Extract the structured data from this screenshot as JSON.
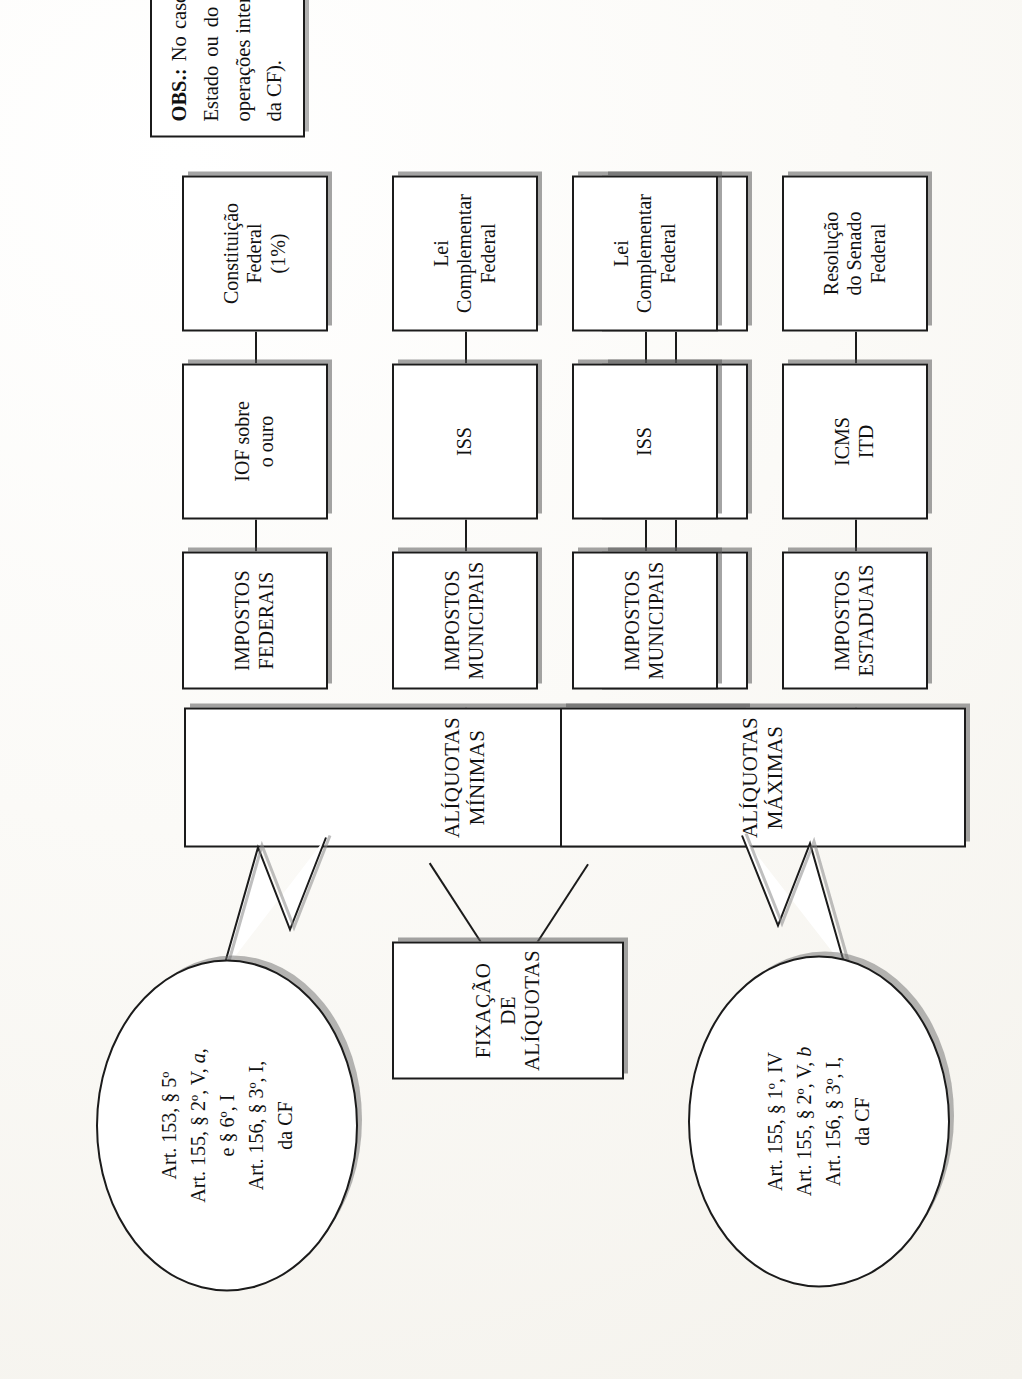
{
  "diagram": {
    "root": {
      "label": "FIXAÇÃO DE\nALÍQUOTAS"
    },
    "branches": [
      {
        "id": "minimas",
        "label": "ALÍQUOTAS\nMÍNIMAS",
        "callout": {
          "lines": [
            "Art. 153, § 5º",
            "Art. 155, § 2º, V, a,",
            "e § 6º, I",
            "Art. 156, § 3º, I,",
            "da CF"
          ]
        },
        "rows": [
          {
            "scope": "IMPOSTOS\nFEDERAIS",
            "tax": "IOF sobre\no ouro",
            "source": "Constituição\nFederal\n(1%)"
          },
          {
            "scope": "IMPOSTOS\nMUNICIPAIS",
            "tax": "ISS",
            "source": "Lei\nComplementar\nFederal"
          },
          {
            "scope": "IMPOSTOS\nESTADUAIS",
            "tax": "ICMS\nIPVA",
            "source": "Resolução\ndo Senado\nFederal"
          }
        ]
      },
      {
        "id": "maximas",
        "label": "ALÍQUOTAS\nMÁXIMAS",
        "callout": {
          "lines": [
            "Art. 155, § 1º, IV",
            "Art. 155, § 2º, V, b",
            "Art. 156, § 3º, I,",
            "da CF"
          ]
        },
        "rows": [
          {
            "scope": "IMPOSTOS\nMUNICIPAIS",
            "tax": "ISS",
            "source": "Lei\nComplementar\nFederal"
          },
          {
            "scope": "IMPOSTOS\nESTADUAIS",
            "tax": "ICMS\nITD",
            "source": "Resolução\ndo Senado\nFederal"
          }
        ]
      }
    ]
  },
  "note": {
    "prefix": "OBS.:",
    "text": " No caso do ICMS, tanto as alíquotas máximas quanto as mínimas dizem respeito às operações internas (dentro do Estado ou do DF), e é facultado ao Senado Federal fixar esses limites, uma vez que, quanto às alíquotas aplicáveis a operações interestaduais e de exportação, o Senado Federal, tem de fiscá-las, e não apenas os seus limites (art. 155, § 2º, IV, da CF)."
  },
  "colors": {
    "ink": "#1b1b1b",
    "paper": "#fbfaf7",
    "shadow": "#6e6e6e"
  }
}
